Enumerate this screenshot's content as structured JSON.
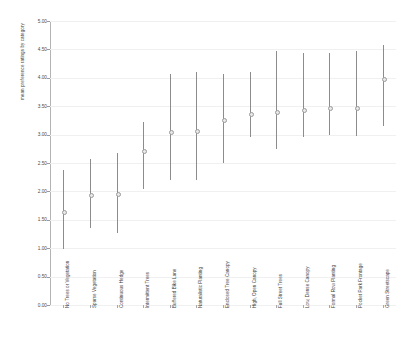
{
  "chart_data": {
    "type": "scatter",
    "title": "",
    "xlabel": "",
    "ylabel": "mean preference ratings by category",
    "ylim": [
      0.0,
      5.0
    ],
    "grid": true,
    "legend": "none",
    "ytick_labels": [
      "5.00",
      "4.50",
      "4.00",
      "3.50",
      "3.00",
      "2.50",
      "2.00",
      "1.50",
      "1.00",
      "0.50",
      "0.00"
    ],
    "ytick_values": [
      5.0,
      4.5,
      4.0,
      3.5,
      3.0,
      2.5,
      2.0,
      1.5,
      1.0,
      0.5,
      0.0
    ],
    "categories": [
      "No Trees or Vegetation",
      "Sparse Vegetation",
      "Continuous Hedge",
      "Intermittent Trees",
      "Buffered Bike Lane",
      "Naturalistic Planting",
      "Enclosed Tree Canopy",
      "High, Open Canopy",
      "Full Street Trees",
      "Low, Dense Canopy",
      "Formal Row Planting",
      "Pocket Park Frontage",
      "Green Streetscape"
    ],
    "series": [
      {
        "name": "mean preference rating",
        "values": [
          1.65,
          1.95,
          1.96,
          2.72,
          3.06,
          3.08,
          3.27,
          3.37,
          3.4,
          3.44,
          3.47,
          3.47,
          3.99
        ],
        "ci_low": [
          0.98,
          1.35,
          1.26,
          2.05,
          2.2,
          2.2,
          2.5,
          2.95,
          2.75,
          2.95,
          3.0,
          2.98,
          3.15
        ],
        "ci_high": [
          2.38,
          2.57,
          2.68,
          3.22,
          4.07,
          4.11,
          4.07,
          4.11,
          4.47,
          4.44,
          4.43,
          4.48,
          4.58
        ]
      }
    ]
  },
  "axis": {
    "y_title": "mean preference ratings by category"
  }
}
